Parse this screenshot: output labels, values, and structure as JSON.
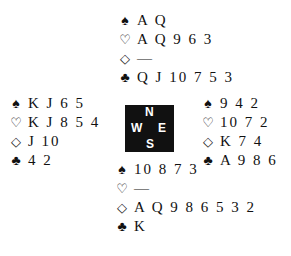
{
  "suit_symbols": {
    "spades": "♠",
    "hearts": "♡",
    "diamonds": "◇",
    "clubs": "♣"
  },
  "compass": {
    "north": "N",
    "south": "S",
    "west": "W",
    "east": "E"
  },
  "hands": {
    "north": {
      "spades": "A Q",
      "hearts": "A Q 9 6 3",
      "diamonds": "—",
      "clubs": "Q J 10 7 5 3"
    },
    "west": {
      "spades": "K J 6 5",
      "hearts": "K J 8 5 4",
      "diamonds": "J 10",
      "clubs": "4 2"
    },
    "east": {
      "spades": "9 4 2",
      "hearts": "10 7 2",
      "diamonds": "K 7 4",
      "clubs": "A 9 8 6"
    },
    "south": {
      "spades": "10 8 7 3",
      "hearts": "—",
      "diamonds": "A Q 9 8 6 5 3 2",
      "clubs": "K"
    }
  }
}
